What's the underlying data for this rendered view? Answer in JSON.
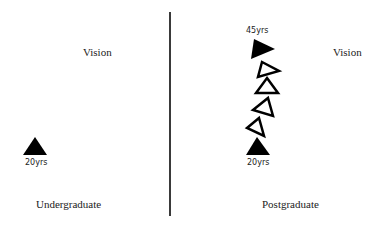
{
  "left_panel": {
    "vision_label": "Vision",
    "start_age": "20yrs",
    "caption": "Undergraduate"
  },
  "right_panel": {
    "vision_label": "Vision",
    "start_age": "20yrs",
    "end_age": "45yrs",
    "caption": "Postgraduate",
    "steps": [
      {
        "type": "filled",
        "rotation": 0
      },
      {
        "type": "hollow",
        "rotation": -20
      },
      {
        "type": "hollow",
        "rotation": 15
      },
      {
        "type": "hollow",
        "rotation": 0
      },
      {
        "type": "hollow",
        "rotation": 20
      },
      {
        "type": "filled",
        "rotation": 30
      }
    ]
  },
  "colors": {
    "ink": "#000000",
    "divider": "#3a3a3a",
    "background": "#ffffff"
  }
}
